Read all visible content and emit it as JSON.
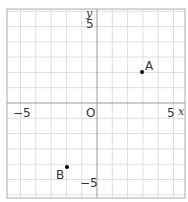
{
  "plane": {
    "x_range": [
      -6,
      6
    ],
    "y_range": [
      -6,
      6
    ],
    "unit_px": 15.3,
    "origin_px": [
      97,
      103
    ],
    "bounds_px": {
      "left": 7,
      "top": 9,
      "right": 185,
      "bottom": 198
    },
    "grid_color": "#dddddd",
    "axis_color": "#999999",
    "border_color": "#aaaaaa"
  },
  "labels": {
    "x_axis": "x",
    "y_axis": "y",
    "origin": "O",
    "x_neg5": "−5",
    "x_pos5": "5",
    "y_pos5": "5",
    "y_neg5": "−5"
  },
  "points": [
    {
      "name": "A",
      "x": 3,
      "y": 2
    },
    {
      "name": "B",
      "x": -2,
      "y": -4
    }
  ],
  "point_labels": {
    "A": "A",
    "B": "B"
  }
}
